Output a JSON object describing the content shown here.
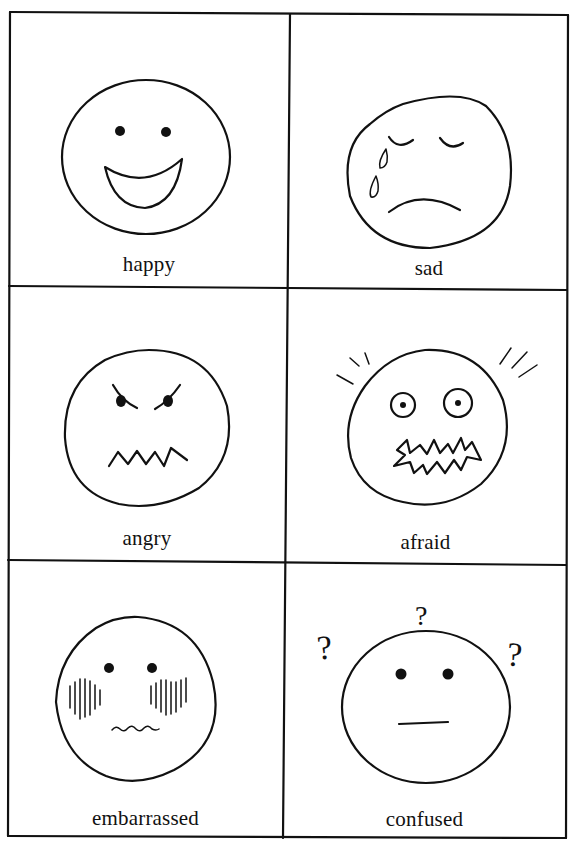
{
  "worksheet": {
    "title": "Feelings faces chart",
    "grid": {
      "rows": 3,
      "columns": 2
    },
    "cells": [
      {
        "emotion": "happy",
        "label": "happy",
        "features": [
          "dot eyes",
          "big open smile"
        ]
      },
      {
        "emotion": "sad",
        "label": "sad",
        "features": [
          "closed eyes",
          "two tear drops",
          "frown"
        ]
      },
      {
        "emotion": "angry",
        "label": "angry",
        "features": [
          "slanted eyebrows",
          "dot eyes",
          "zigzag mouth"
        ]
      },
      {
        "emotion": "afraid",
        "label": "afraid",
        "features": [
          "wide circle eyes",
          "shake lines",
          "jagged open mouth"
        ]
      },
      {
        "emotion": "embarrassed",
        "label": "embarrassed",
        "features": [
          "dot eyes",
          "blushing cheek hatching",
          "wavy mouth"
        ]
      },
      {
        "emotion": "confused",
        "label": "confused",
        "features": [
          "dot eyes",
          "three question marks",
          "flat mouth"
        ]
      }
    ],
    "question_mark_glyph": "?",
    "colors": {
      "ink": "#111111",
      "paper": "#ffffff"
    }
  }
}
